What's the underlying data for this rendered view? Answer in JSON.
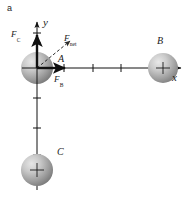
{
  "figure": {
    "panel_letter": "a",
    "background_color": "#ffffff",
    "width": 187,
    "height": 199
  },
  "axes": {
    "x_axis_label": "x",
    "y_axis_label": "y",
    "axis_color": "#111111",
    "origin": {
      "x": 37,
      "y": 68
    },
    "x_tick_positions": [
      64,
      93,
      121
    ],
    "y_tick_positions": [
      33,
      43,
      98,
      128,
      155
    ],
    "x_axis_end": {
      "x": 180,
      "y": 68
    },
    "y_axis_end": {
      "x": 37,
      "y": 20
    }
  },
  "spheres": [
    {
      "name": "sphere-a",
      "label": "A",
      "cx": 37,
      "cy": 68,
      "r": 16,
      "color_light": "#d8d8d8",
      "color_dark": "#7d7d7d"
    },
    {
      "name": "sphere-b",
      "label": "B",
      "cx": 163,
      "cy": 68,
      "r": 15,
      "color_light": "#dadada",
      "color_dark": "#7f7f7f"
    },
    {
      "name": "sphere-c",
      "label": "C",
      "cx": 37,
      "cy": 170,
      "r": 16,
      "color_light": "#d8d8d8",
      "color_dark": "#7d7d7d"
    }
  ],
  "vectors": [
    {
      "name": "force-c-vector",
      "label": "F",
      "subscript": "C",
      "from": {
        "x": 37,
        "y": 68
      },
      "to": {
        "x": 37,
        "y": 33
      },
      "style": "solid",
      "color": "#101010"
    },
    {
      "name": "force-b-vector",
      "label": "F",
      "subscript": "B",
      "from": {
        "x": 37,
        "y": 68
      },
      "to": {
        "x": 67,
        "y": 68
      },
      "style": "solid",
      "color": "#101010"
    },
    {
      "name": "force-net-vector",
      "label": "F",
      "subscript": "net",
      "from": {
        "x": 37,
        "y": 68
      },
      "to": {
        "x": 71,
        "y": 40
      },
      "style": "dashed",
      "color": "#303030"
    }
  ],
  "labels": {
    "force_c": "F",
    "force_c_sub": "C",
    "force_b": "F",
    "force_b_sub": "B",
    "force_net": "F",
    "force_net_sub": "net",
    "point_a": "A",
    "point_b": "B",
    "point_c": "C",
    "axis_x": "x",
    "axis_y": "y",
    "panel": "a"
  }
}
